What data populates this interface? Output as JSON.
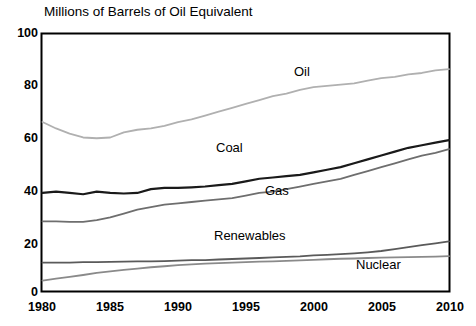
{
  "chart_data": {
    "type": "line",
    "title": "Millions of Barrels of Oil Equivalent",
    "xlabel": "",
    "ylabel": "",
    "xlim": [
      1980,
      2010
    ],
    "ylim": [
      0,
      100
    ],
    "grid": false,
    "legend_position": "inline-labels",
    "x_ticks": [
      "1980",
      "1985",
      "1990",
      "1995",
      "2000",
      "2005",
      "2010"
    ],
    "y_ticks": [
      "0",
      "20",
      "40",
      "60",
      "80",
      "100"
    ],
    "x": [
      1980,
      1981,
      1982,
      1983,
      1984,
      1985,
      1986,
      1987,
      1988,
      1989,
      1990,
      1991,
      1992,
      1993,
      1994,
      1995,
      1996,
      1997,
      1998,
      1999,
      2000,
      2001,
      2002,
      2003,
      2004,
      2005,
      2006,
      2007,
      2008,
      2009,
      2010
    ],
    "series": [
      {
        "name": "Oil",
        "color": "#b0b0b0",
        "values": [
          65.5,
          63.0,
          61.0,
          59.5,
          59.2,
          59.5,
          61.5,
          62.5,
          63.0,
          64.0,
          65.5,
          66.5,
          68.0,
          69.5,
          71.0,
          72.5,
          74.0,
          75.5,
          76.5,
          78.0,
          79.0,
          79.5,
          80.0,
          80.5,
          81.5,
          82.5,
          83.0,
          84.0,
          84.5,
          85.5,
          86.0
        ]
      },
      {
        "name": "Coal",
        "color": "#1a1a1a",
        "values": [
          38.0,
          38.5,
          38.0,
          37.5,
          38.5,
          38.0,
          37.8,
          38.0,
          39.5,
          40.0,
          40.0,
          40.2,
          40.5,
          41.0,
          41.5,
          42.5,
          43.5,
          44.0,
          44.5,
          45.0,
          46.0,
          47.0,
          48.0,
          49.5,
          51.0,
          52.5,
          54.0,
          55.5,
          56.5,
          57.5,
          58.5
        ]
      },
      {
        "name": "Gas",
        "color": "#6e6e6e",
        "values": [
          27.0,
          27.0,
          26.8,
          26.8,
          27.5,
          28.5,
          30.0,
          31.5,
          32.5,
          33.5,
          34.0,
          34.5,
          35.0,
          35.5,
          36.0,
          37.0,
          38.0,
          38.5,
          39.5,
          40.5,
          41.5,
          42.5,
          43.5,
          45.0,
          46.5,
          48.0,
          49.5,
          51.0,
          52.5,
          53.5,
          55.0
        ]
      },
      {
        "name": "Renewables",
        "color": "#5a5a5a",
        "values": [
          11.0,
          11.0,
          11.0,
          11.2,
          11.2,
          11.3,
          11.4,
          11.5,
          11.5,
          11.6,
          11.8,
          12.0,
          12.0,
          12.2,
          12.4,
          12.6,
          12.8,
          13.0,
          13.2,
          13.4,
          13.8,
          14.0,
          14.3,
          14.6,
          15.0,
          15.5,
          16.2,
          17.0,
          17.8,
          18.5,
          19.2
        ]
      },
      {
        "name": "Nuclear",
        "color": "#8a8a8a",
        "values": [
          4.0,
          4.8,
          5.5,
          6.2,
          7.0,
          7.6,
          8.2,
          8.7,
          9.2,
          9.6,
          10.0,
          10.3,
          10.6,
          10.8,
          11.0,
          11.2,
          11.4,
          11.5,
          11.7,
          11.9,
          12.1,
          12.3,
          12.5,
          12.6,
          12.8,
          12.9,
          13.0,
          13.1,
          13.2,
          13.3,
          13.5
        ]
      }
    ],
    "annotations": [
      {
        "text": "Oil",
        "x": 294,
        "y": 64
      },
      {
        "text": "Coal",
        "x": 216,
        "y": 140
      },
      {
        "text": "Gas",
        "x": 265,
        "y": 183
      },
      {
        "text": "Renewables",
        "x": 214,
        "y": 228
      },
      {
        "text": "Nuclear",
        "x": 356,
        "y": 257
      }
    ]
  },
  "axes": {
    "y_tick_positions": [
      {
        "label": "100",
        "left": 4,
        "top": 26
      },
      {
        "label": "80",
        "left": 4,
        "top": 78
      },
      {
        "label": "60",
        "left": 4,
        "top": 131
      },
      {
        "label": "40",
        "left": 4,
        "top": 184
      },
      {
        "label": "20",
        "left": 4,
        "top": 237
      },
      {
        "label": "0",
        "left": 4,
        "top": 285
      }
    ],
    "x_tick_positions": [
      {
        "label": "1980",
        "left": 19,
        "top": 300
      },
      {
        "label": "1985",
        "left": 87,
        "top": 300
      },
      {
        "label": "1990",
        "left": 155,
        "top": 300
      },
      {
        "label": "1995",
        "left": 223,
        "top": 300
      },
      {
        "label": "2000",
        "left": 291,
        "top": 300
      },
      {
        "label": "2005",
        "left": 359,
        "top": 300
      },
      {
        "label": "2010",
        "left": 427,
        "top": 300
      }
    ]
  }
}
